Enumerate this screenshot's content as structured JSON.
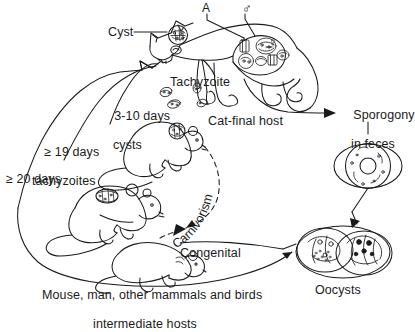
{
  "figure": {
    "background": "#ffffff",
    "ink": "#1a1a1a"
  },
  "labels": {
    "cyst": "Cyst",
    "tachyzoite": "Tachyzoite",
    "days_3_10_line1": "3-10 days",
    "days_3_10_line2": "cysts",
    "days_19_line1": "≥ 19 days",
    "days_19_line2": "tachyzoites",
    "days_20": "≥ 20 days",
    "cat_final_host": "Cat-final host",
    "sporogony_line1": "Sporogony",
    "sporogony_line2": "in feces",
    "oocysts": "Oocysts",
    "congenital": "Congenital",
    "carnivorism": "Carnivorism",
    "hosts_line1": "Mouse, man, other mammals and birds",
    "hosts_line2": "intermediate hosts",
    "marker_A": "A",
    "marker_male": "♂",
    "marker_female": "♀"
  }
}
